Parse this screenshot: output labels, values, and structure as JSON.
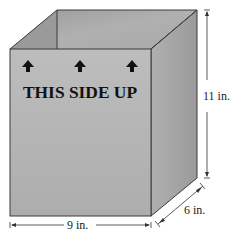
{
  "diagram": {
    "type": "open rectangular box (rectangular prism) with dimensions",
    "box_text": "THIS SIDE UP",
    "arrow_count": 3,
    "dimensions": {
      "width": "9 in.",
      "depth": "6 in.",
      "height": "11 in."
    },
    "colors": {
      "front_face": "#b4b4b4",
      "right_face": "#a3a3a3",
      "interior_back": "#a9a9a9",
      "interior_left": "#9e9e9e",
      "edge": "#3a3a3a",
      "text": "#111111"
    }
  }
}
